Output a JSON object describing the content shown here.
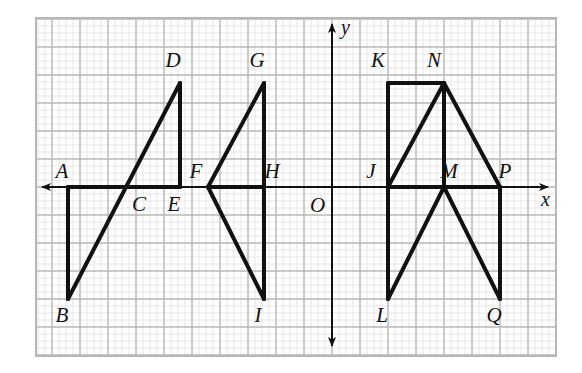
{
  "figure": {
    "background_color": "#ffffff",
    "frame": {
      "x": 36,
      "y": 18,
      "width": 520,
      "height": 338,
      "stroke": "#b8b8b8",
      "stroke_width": 2
    },
    "grid": {
      "minor_spacing": 7,
      "major_spacing": 28,
      "minor_color": "#e6e6e6",
      "major_color": "#bbbbbb",
      "origin_px": {
        "x": 332,
        "y": 187
      },
      "unit_px": 28,
      "visible": true
    },
    "axes": {
      "x_axis": {
        "label": "x",
        "label_px": {
          "x": 541,
          "y": 206
        },
        "from_px": {
          "x": 42,
          "y": 187
        },
        "to_px": {
          "x": 548,
          "y": 187
        },
        "arrows": "both"
      },
      "y_axis": {
        "label": "y",
        "label_px": {
          "x": 341,
          "y": 34
        },
        "from_px": {
          "x": 332,
          "y": 346
        },
        "to_px": {
          "x": 332,
          "y": 24
        },
        "arrows": "both"
      },
      "origin": {
        "label": "O",
        "label_px": {
          "x": 310,
          "y": 212
        }
      },
      "stroke": "#111111",
      "stroke_width": 2
    },
    "stroke": {
      "shape_color": "#111111",
      "shape_width": 4
    },
    "points": [
      {
        "name": "A",
        "px": {
          "x": 68,
          "y": 187
        },
        "grid": {
          "x": -9.43,
          "y": 0
        },
        "label_px": {
          "x": 62,
          "y": 178
        }
      },
      {
        "name": "B",
        "px": {
          "x": 68,
          "y": 299
        },
        "grid": {
          "x": -9.43,
          "y": -4
        },
        "label_px": {
          "x": 62,
          "y": 322
        }
      },
      {
        "name": "C",
        "px": {
          "x": 152,
          "y": 187
        },
        "grid": {
          "x": -6.43,
          "y": 0
        },
        "label_px": {
          "x": 139,
          "y": 211
        }
      },
      {
        "name": "D",
        "px": {
          "x": 180,
          "y": 83
        },
        "grid": {
          "x": -5.43,
          "y": 3.71
        },
        "label_px": {
          "x": 173,
          "y": 67
        }
      },
      {
        "name": "E",
        "px": {
          "x": 180,
          "y": 187
        },
        "grid": {
          "x": -5.43,
          "y": 0
        },
        "label_px": {
          "x": 174,
          "y": 211
        }
      },
      {
        "name": "F",
        "px": {
          "x": 208,
          "y": 187
        },
        "grid": {
          "x": -4.43,
          "y": 0
        },
        "label_px": {
          "x": 196,
          "y": 178
        }
      },
      {
        "name": "G",
        "px": {
          "x": 264,
          "y": 83
        },
        "grid": {
          "x": -2.43,
          "y": 3.71
        },
        "label_px": {
          "x": 257,
          "y": 67
        }
      },
      {
        "name": "H",
        "px": {
          "x": 264,
          "y": 187
        },
        "grid": {
          "x": -2.43,
          "y": 0
        },
        "label_px": {
          "x": 272,
          "y": 178
        }
      },
      {
        "name": "I",
        "px": {
          "x": 264,
          "y": 299
        },
        "grid": {
          "x": -2.43,
          "y": -4
        },
        "label_px": {
          "x": 258,
          "y": 322
        }
      },
      {
        "name": "J",
        "px": {
          "x": 388,
          "y": 187
        },
        "grid": {
          "x": 2,
          "y": 0
        },
        "label_px": {
          "x": 371,
          "y": 178
        }
      },
      {
        "name": "K",
        "px": {
          "x": 388,
          "y": 83
        },
        "grid": {
          "x": 2,
          "y": 3.71
        },
        "label_px": {
          "x": 378,
          "y": 67
        }
      },
      {
        "name": "L",
        "px": {
          "x": 388,
          "y": 299
        },
        "grid": {
          "x": 2,
          "y": -4
        },
        "label_px": {
          "x": 382,
          "y": 322
        }
      },
      {
        "name": "M",
        "px": {
          "x": 444,
          "y": 187
        },
        "grid": {
          "x": 4,
          "y": 0
        },
        "label_px": {
          "x": 449,
          "y": 178
        }
      },
      {
        "name": "N",
        "px": {
          "x": 444,
          "y": 83
        },
        "grid": {
          "x": 4,
          "y": 3.71
        },
        "label_px": {
          "x": 434,
          "y": 67
        }
      },
      {
        "name": "P",
        "px": {
          "x": 500,
          "y": 187
        },
        "grid": {
          "x": 6,
          "y": 0
        },
        "label_px": {
          "x": 505,
          "y": 178
        }
      },
      {
        "name": "Q",
        "px": {
          "x": 500,
          "y": 299
        },
        "grid": {
          "x": 6,
          "y": -4
        },
        "label_px": {
          "x": 494,
          "y": 322
        }
      }
    ],
    "shapes": [
      {
        "id": "shape-left-ABCDE",
        "segments": [
          {
            "from": "A",
            "to": "E"
          },
          {
            "from": "A",
            "to": "B"
          },
          {
            "from": "B",
            "to": "D"
          },
          {
            "from": "D",
            "to": "E"
          }
        ]
      },
      {
        "id": "shape-middle-FGHI",
        "segments": [
          {
            "from": "F",
            "to": "H"
          },
          {
            "from": "F",
            "to": "G"
          },
          {
            "from": "G",
            "to": "I"
          },
          {
            "from": "F",
            "to": "I"
          }
        ]
      },
      {
        "id": "shape-right-JKLMNPQ",
        "segments": [
          {
            "from": "J",
            "to": "K"
          },
          {
            "from": "K",
            "to": "N"
          },
          {
            "from": "J",
            "to": "N"
          },
          {
            "from": "N",
            "to": "M"
          },
          {
            "from": "N",
            "to": "P"
          },
          {
            "from": "J",
            "to": "P"
          },
          {
            "from": "J",
            "to": "L"
          },
          {
            "from": "L",
            "to": "M"
          },
          {
            "from": "M",
            "to": "Q"
          },
          {
            "from": "P",
            "to": "Q"
          }
        ]
      }
    ]
  },
  "chart_data": {
    "type": "scatter",
    "xlabel": "x",
    "ylabel": "y",
    "grid": true,
    "legend": "none",
    "annotations": [
      "A",
      "B",
      "C",
      "D",
      "E",
      "F",
      "G",
      "H",
      "I",
      "J",
      "K",
      "L",
      "M",
      "N",
      "O",
      "P",
      "Q"
    ]
  }
}
